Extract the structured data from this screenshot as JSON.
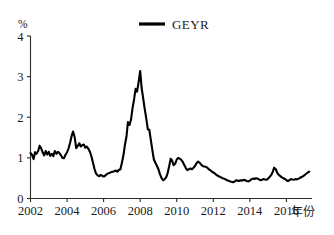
{
  "chart_data": {
    "type": "line",
    "title": "",
    "subtitle": "",
    "xlabel": "年份",
    "ylabel": "%",
    "y_unit_label": "%",
    "xlim": [
      2002.0,
      2017.4
    ],
    "ylim": [
      0,
      4
    ],
    "xticks": [
      2002,
      2004,
      2006,
      2008,
      2010,
      2012,
      2014,
      2016
    ],
    "xtick_labels": [
      "2002",
      "2004",
      "2006",
      "2008",
      "2010",
      "2012",
      "2014",
      "2016"
    ],
    "yticks": [
      0,
      1,
      2,
      3,
      4
    ],
    "ytick_labels": [
      "0",
      "1",
      "2",
      "3",
      "4"
    ],
    "grid": false,
    "legend_position": "top-center",
    "legend": [
      "GEYR"
    ],
    "series": [
      {
        "name": "GEYR",
        "color": "#000000",
        "x": [
          2002.0,
          2002.08,
          2002.17,
          2002.25,
          2002.33,
          2002.42,
          2002.5,
          2002.58,
          2002.67,
          2002.75,
          2002.83,
          2002.92,
          2003.0,
          2003.08,
          2003.17,
          2003.25,
          2003.33,
          2003.42,
          2003.5,
          2003.58,
          2003.67,
          2003.75,
          2003.83,
          2003.92,
          2004.0,
          2004.08,
          2004.17,
          2004.25,
          2004.33,
          2004.42,
          2004.5,
          2004.58,
          2004.67,
          2004.75,
          2004.83,
          2004.92,
          2005.0,
          2005.08,
          2005.17,
          2005.25,
          2005.33,
          2005.42,
          2005.5,
          2005.58,
          2005.67,
          2005.75,
          2005.83,
          2005.92,
          2006.0,
          2006.08,
          2006.17,
          2006.25,
          2006.33,
          2006.42,
          2006.5,
          2006.58,
          2006.67,
          2006.75,
          2006.83,
          2006.92,
          2007.0,
          2007.08,
          2007.17,
          2007.25,
          2007.33,
          2007.42,
          2007.5,
          2007.58,
          2007.67,
          2007.75,
          2007.83,
          2007.92,
          2008.0,
          2008.08,
          2008.17,
          2008.25,
          2008.33,
          2008.42,
          2008.5,
          2008.58,
          2008.67,
          2008.75,
          2008.83,
          2008.92,
          2009.0,
          2009.08,
          2009.17,
          2009.25,
          2009.33,
          2009.42,
          2009.5,
          2009.58,
          2009.67,
          2009.75,
          2009.83,
          2009.92,
          2010.0,
          2010.08,
          2010.17,
          2010.25,
          2010.33,
          2010.42,
          2010.5,
          2010.58,
          2010.67,
          2010.75,
          2010.83,
          2010.92,
          2011.0,
          2011.08,
          2011.17,
          2011.25,
          2011.33,
          2011.42,
          2011.5,
          2011.58,
          2011.67,
          2011.75,
          2011.83,
          2011.92,
          2012.0,
          2012.08,
          2012.17,
          2012.25,
          2012.33,
          2012.42,
          2012.5,
          2012.58,
          2012.67,
          2012.75,
          2012.83,
          2012.92,
          2013.0,
          2013.08,
          2013.17,
          2013.25,
          2013.33,
          2013.42,
          2013.5,
          2013.58,
          2013.67,
          2013.75,
          2013.83,
          2013.92,
          2014.0,
          2014.08,
          2014.17,
          2014.25,
          2014.33,
          2014.42,
          2014.5,
          2014.58,
          2014.67,
          2014.75,
          2014.83,
          2014.92,
          2015.0,
          2015.08,
          2015.17,
          2015.25,
          2015.33,
          2015.42,
          2015.5,
          2015.58,
          2015.67,
          2015.75,
          2015.83,
          2015.92,
          2016.0,
          2016.08,
          2016.17,
          2016.25,
          2016.33,
          2016.42,
          2016.5,
          2016.58,
          2016.67,
          2016.75,
          2016.83,
          2016.92,
          2017.0,
          2017.08,
          2017.17,
          2017.25
        ],
        "values": [
          1.12,
          1.08,
          0.97,
          1.14,
          1.1,
          1.17,
          1.3,
          1.24,
          1.13,
          1.06,
          1.17,
          1.08,
          1.15,
          1.05,
          1.1,
          1.04,
          1.17,
          1.1,
          1.15,
          1.12,
          1.06,
          1.0,
          0.99,
          1.08,
          1.14,
          1.23,
          1.38,
          1.54,
          1.65,
          1.5,
          1.24,
          1.29,
          1.36,
          1.28,
          1.31,
          1.33,
          1.25,
          1.28,
          1.22,
          1.15,
          1.04,
          0.88,
          0.73,
          0.62,
          0.57,
          0.55,
          0.58,
          0.56,
          0.54,
          0.56,
          0.6,
          0.62,
          0.63,
          0.65,
          0.66,
          0.67,
          0.69,
          0.66,
          0.7,
          0.72,
          0.88,
          1.05,
          1.33,
          1.52,
          1.88,
          1.81,
          1.95,
          2.22,
          2.45,
          2.7,
          2.63,
          2.88,
          3.14,
          2.72,
          2.45,
          2.2,
          1.98,
          1.7,
          1.69,
          1.45,
          1.18,
          0.96,
          0.88,
          0.8,
          0.72,
          0.6,
          0.5,
          0.45,
          0.47,
          0.52,
          0.62,
          0.78,
          0.98,
          0.93,
          0.82,
          0.86,
          0.96,
          1.0,
          0.98,
          0.95,
          0.9,
          0.82,
          0.75,
          0.7,
          0.72,
          0.74,
          0.72,
          0.76,
          0.8,
          0.87,
          0.91,
          0.88,
          0.84,
          0.8,
          0.79,
          0.78,
          0.76,
          0.72,
          0.7,
          0.66,
          0.64,
          0.62,
          0.58,
          0.56,
          0.54,
          0.52,
          0.5,
          0.49,
          0.47,
          0.45,
          0.44,
          0.42,
          0.41,
          0.4,
          0.42,
          0.45,
          0.44,
          0.43,
          0.45,
          0.44,
          0.46,
          0.45,
          0.43,
          0.42,
          0.44,
          0.47,
          0.49,
          0.48,
          0.5,
          0.49,
          0.47,
          0.45,
          0.46,
          0.48,
          0.47,
          0.46,
          0.49,
          0.53,
          0.58,
          0.65,
          0.76,
          0.72,
          0.63,
          0.58,
          0.55,
          0.52,
          0.5,
          0.48,
          0.45,
          0.43,
          0.45,
          0.48,
          0.47,
          0.46,
          0.48,
          0.47,
          0.49,
          0.51,
          0.53,
          0.55,
          0.58,
          0.61,
          0.64,
          0.66
        ]
      }
    ]
  },
  "legend": {
    "entries": [
      {
        "label": "GEYR",
        "color": "#000000"
      }
    ]
  },
  "axes": {
    "y_unit": "%",
    "x_title": "年份"
  },
  "colors": {
    "series": "#000000",
    "axis": "#2b2b2b",
    "background": "#ffffff"
  }
}
